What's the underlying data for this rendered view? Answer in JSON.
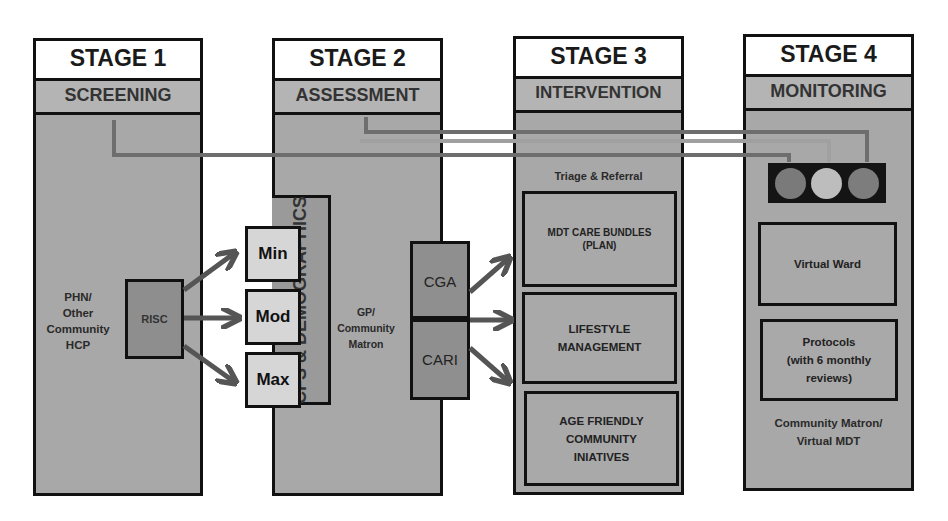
{
  "stages": [
    {
      "title": "STAGE 1",
      "subtitle": "SCREENING"
    },
    {
      "title": "STAGE 2",
      "subtitle": "ASSESSMENT"
    },
    {
      "title": "STAGE 3",
      "subtitle": "INTERVENTION"
    },
    {
      "title": "STAGE 4",
      "subtitle": "MONITORING"
    }
  ],
  "stage1": {
    "actor": [
      "PHN/",
      "Other",
      "Community",
      "HCP"
    ],
    "tool": "RISC"
  },
  "stage2": {
    "levels": [
      "Min",
      "Mod",
      "Max"
    ],
    "sidebar": "CFS & DEMOGRAPHICS",
    "actor": [
      "GP/",
      "Community",
      "Matron"
    ],
    "tools": [
      "CGA",
      "CARI"
    ]
  },
  "stage3": {
    "heading": "Triage & Referral",
    "boxes": [
      [
        "MDT CARE BUNDLES",
        "(PLAN)"
      ],
      [
        "LIFESTYLE",
        "MANAGEMENT"
      ],
      [
        "AGE FRIENDLY",
        "COMMUNITY",
        "INIATIVES"
      ]
    ]
  },
  "stage4": {
    "traffic_light": [
      "red",
      "amber",
      "green"
    ],
    "boxes": [
      [
        "Virtual Ward"
      ],
      [
        "Protocols",
        "(with 6 monthly",
        "reviews)"
      ]
    ],
    "actor": [
      "Community Matron/",
      "Virtual MDT"
    ]
  },
  "colors": {
    "panel": "#a8a8a8",
    "connector": "#6e6e6e",
    "arrow": "#555555",
    "light_red": "#7a7a7a",
    "light_amber": "#bdbdbd",
    "light_green": "#7d7d7d"
  }
}
